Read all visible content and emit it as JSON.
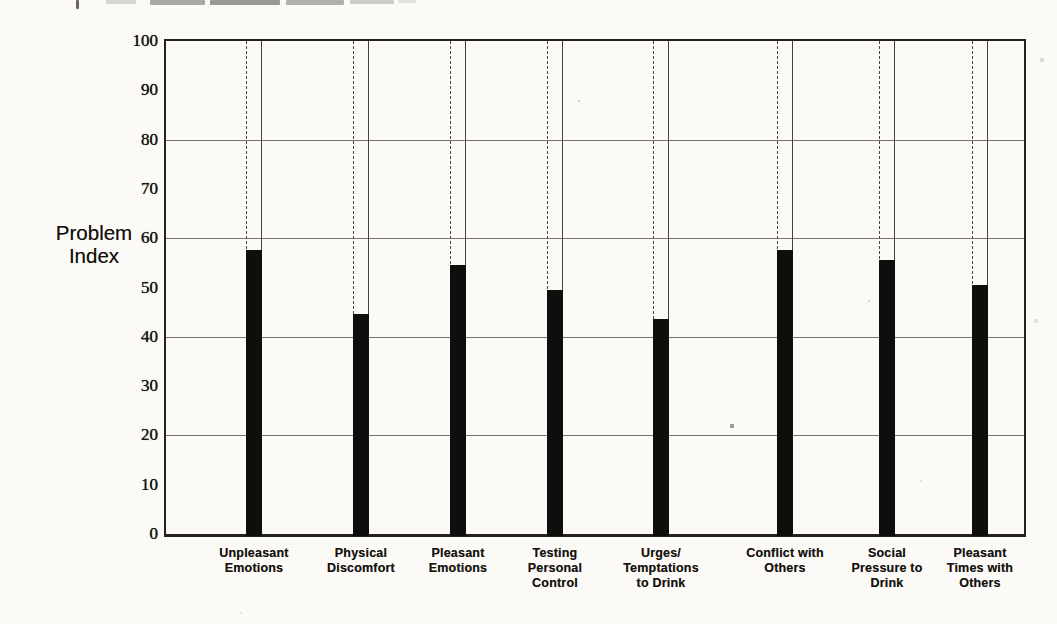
{
  "chart_data": {
    "type": "bar",
    "title": "",
    "ylabel": "Problem Index",
    "ylabel_lines": [
      "Problem",
      "Index"
    ],
    "categories": [
      "Unpleasant Emotions",
      "Physical Discomfort",
      "Pleasant Emotions",
      "Testing Personal Control",
      "Urges/ Temptations to Drink",
      "Conflict with Others",
      "Social Pressure to Drink",
      "Pleasant Times with Others"
    ],
    "category_lines": [
      [
        "Unpleasant",
        "Emotions"
      ],
      [
        "Physical",
        "Discomfort"
      ],
      [
        "Pleasant",
        "Emotions"
      ],
      [
        "Testing",
        "Personal",
        "Control"
      ],
      [
        "Urges/",
        "Temptations",
        "to Drink"
      ],
      [
        "Conflict with",
        "Others"
      ],
      [
        "Social",
        "Pressure to",
        "Drink"
      ],
      [
        "Pleasant",
        "Times with",
        "Others"
      ]
    ],
    "values": [
      58,
      45,
      55,
      50,
      44,
      58,
      56,
      51
    ],
    "ylim": [
      0,
      100
    ],
    "yticks": [
      0,
      10,
      20,
      30,
      40,
      50,
      60,
      70,
      80,
      90,
      100
    ],
    "gridlines": [
      20,
      40,
      60,
      80
    ],
    "grid": true,
    "legend": null,
    "bar_color": "#0f0e0c",
    "axis_color": "#26231e",
    "grid_color": "#56514a",
    "layout": {
      "plot_left": 164,
      "plot_top": 39,
      "plot_width": 862,
      "plot_height": 498,
      "bar_width": 16,
      "bar_centers": [
        254,
        361,
        458,
        555,
        661,
        785,
        887,
        980
      ],
      "xlabel_top": 546,
      "ytick_right_edge": 158
    }
  }
}
